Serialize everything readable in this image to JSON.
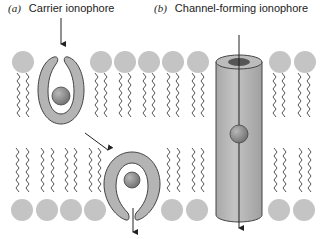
{
  "panels": [
    {
      "tag": "(a)",
      "title": "Carrier ionophore"
    },
    {
      "tag": "(b)",
      "title": "Channel-forming ionophore"
    }
  ],
  "colors": {
    "lipid_head": "#c4c4c4",
    "ionophore_body": "#b4b4b4",
    "ion": "#8a8a8a",
    "outline": "#444444"
  }
}
